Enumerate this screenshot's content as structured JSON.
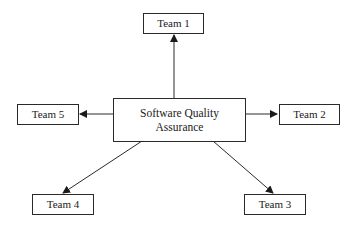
{
  "diagram": {
    "type": "hub-and-spoke",
    "center": {
      "id": "sqa",
      "line1": "Software Quality",
      "line2": "Assurance"
    },
    "nodes": [
      {
        "id": "team1",
        "label": "Team 1"
      },
      {
        "id": "team2",
        "label": "Team 2"
      },
      {
        "id": "team3",
        "label": "Team 3"
      },
      {
        "id": "team4",
        "label": "Team 4"
      },
      {
        "id": "team5",
        "label": "Team 5"
      }
    ],
    "edges": [
      {
        "from": "sqa",
        "to": "team1",
        "directed": true
      },
      {
        "from": "sqa",
        "to": "team2",
        "directed": true
      },
      {
        "from": "sqa",
        "to": "team3",
        "directed": true
      },
      {
        "from": "sqa",
        "to": "team4",
        "directed": true
      },
      {
        "from": "sqa",
        "to": "team5",
        "directed": true
      }
    ],
    "colors": {
      "stroke": "#2a2a2a",
      "text": "#1a1a1a",
      "background": "#ffffff"
    }
  }
}
